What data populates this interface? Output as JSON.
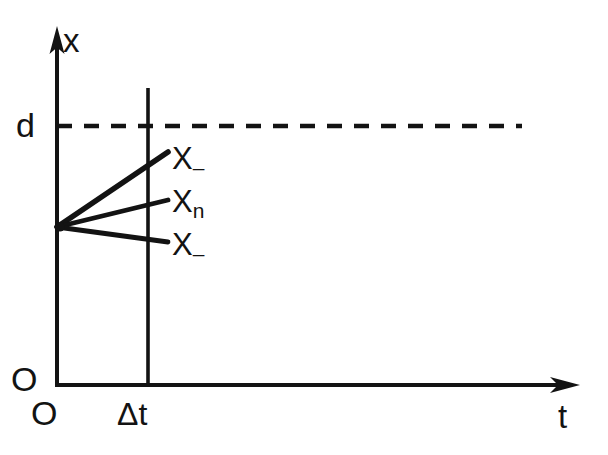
{
  "figure": {
    "kind": "line-diagram",
    "background_color": "#ffffff",
    "ink_color": "#131313",
    "axes": {
      "x_axis": {
        "name": "x-axis",
        "label": "x",
        "orientation": "vertical",
        "arrow": "up",
        "x": 57,
        "y_top": 28,
        "y_bottom": 385
      },
      "t_axis": {
        "name": "t-axis",
        "label": "t",
        "orientation": "horizontal",
        "arrow": "right",
        "y": 385,
        "x_left": 57,
        "x_right": 578
      },
      "origin_labels": [
        {
          "text": "O",
          "role": "origin-upper"
        },
        {
          "text": "O",
          "role": "origin-lower"
        }
      ]
    },
    "threshold": {
      "name": "threshold-line-d",
      "label": "d",
      "style": "dashed",
      "y": 126,
      "x_start": 57,
      "x_end": 522
    },
    "time_marker": {
      "name": "delta-t-marker",
      "label": "Δt",
      "style": "solid",
      "x": 148,
      "y_top": 88,
      "y_bottom": 385
    },
    "trajectories": {
      "fan_origin": {
        "x": 57,
        "y": 227
      },
      "lines": [
        {
          "label_main": "X",
          "label_sub": "–",
          "x_end": 168,
          "y_end": 152,
          "stroke_width": 5.5
        },
        {
          "label_main": "X",
          "label_sub": "n",
          "x_end": 168,
          "y_end": 200,
          "stroke_width": 4.6
        },
        {
          "label_main": "X",
          "label_sub": "–",
          "x_end": 168,
          "y_end": 242,
          "stroke_width": 4.6
        }
      ]
    }
  }
}
